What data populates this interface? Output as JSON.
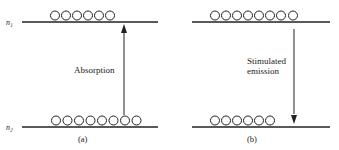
{
  "figure": {
    "level_labels": {
      "upper": "n₁",
      "lower": "n₂"
    },
    "panels": [
      {
        "id": "a",
        "caption": "(a)",
        "process_label": "Absorption",
        "arrow_direction": "up",
        "upper_level_atoms": 6,
        "lower_level_atoms": 8
      },
      {
        "id": "b",
        "caption": "(b)",
        "process_label_line1": "Stimulated",
        "process_label_line2": "emission",
        "arrow_direction": "down",
        "upper_level_atoms": 8,
        "lower_level_atoms": 6
      }
    ]
  }
}
